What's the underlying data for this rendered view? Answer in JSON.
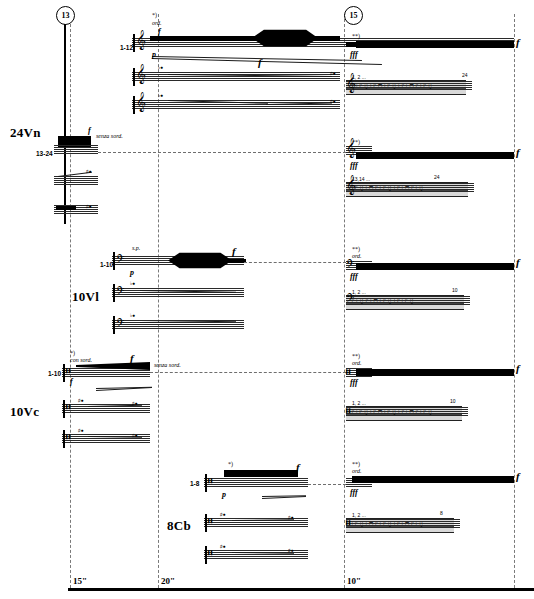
{
  "page": {
    "width": 534,
    "height": 599,
    "kind": "orchestral-graphic-score",
    "background": "#ffffff",
    "ink": "#000000"
  },
  "rehearsal_marks": [
    {
      "id": "mark-left",
      "label": "13",
      "x": 56,
      "y": 6
    },
    {
      "id": "mark-right",
      "label": "15",
      "x": 344,
      "y": 6
    }
  ],
  "systems": [
    {
      "id": "violins",
      "instrument_label": "24Vn",
      "player_ranges": [
        "1-12",
        "13-24"
      ],
      "techniques": [
        "ord.",
        "senza sord.",
        "s.p."
      ],
      "dynamics": [
        "p",
        "f",
        "fff"
      ],
      "footnotes": [
        "*)",
        "**)"
      ],
      "divisi_note": "1, 2 ..."
    },
    {
      "id": "violas",
      "instrument_label": "10Vl",
      "player_ranges": [
        "1-10"
      ],
      "techniques": [
        "s.p.",
        "ord."
      ],
      "dynamics": [
        "p",
        "f",
        "fff"
      ],
      "footnotes": [
        "**)"
      ],
      "divisi_note": "1, 2 ..."
    },
    {
      "id": "cellos",
      "instrument_label": "10Vc",
      "player_ranges": [
        "1-10"
      ],
      "techniques": [
        "con sord.",
        "senza sord.",
        "ord."
      ],
      "dynamics": [
        "f",
        "fff"
      ],
      "footnotes": [
        "*)",
        "**)"
      ],
      "divisi_note": "1, 2 ..."
    },
    {
      "id": "basses",
      "instrument_label": "8Cb",
      "player_ranges": [
        "1-8"
      ],
      "techniques": [
        "ord."
      ],
      "dynamics": [
        "p",
        "f",
        "fff"
      ],
      "footnotes": [
        "*)",
        "**)"
      ],
      "divisi_note": "1, 2 ..."
    }
  ],
  "labels": {
    "vn": "24Vn",
    "vl": "10Vl",
    "vc": "10Vc",
    "cb": "8Cb",
    "vn_range_upper": "1-12",
    "vn_range_lower": "13-24",
    "vl_range": "1-10",
    "vc_range": "1-10",
    "cb_range": "1-8",
    "ord": "ord.",
    "senza_sord": "senza sord.",
    "con_sord": "con sord.",
    "sp": "s.p.",
    "fn_one": "*)",
    "fn_two": "**)",
    "p": "p",
    "f": "f",
    "fff": "fff",
    "divisi_low": "1, 2 ...",
    "divisi_vn_low": "13,14 ...",
    "end_24": "24",
    "end_10": "10",
    "end_8": "8"
  },
  "timeline": {
    "marks": [
      {
        "label": "15\"",
        "x": 70
      },
      {
        "label": "20\"",
        "x": 158
      },
      {
        "label": "10\"",
        "x": 344
      }
    ],
    "bar_y": 588
  },
  "note_glyphs": {
    "row_a": "♪♩♪♫♩♪♬♩♪♫♩♪♩♬♪♩♪♫",
    "row_b": "♩♪♫♩♬♪♩♪♫♩♪♩♬♪♩♫",
    "row_c": "♪♩♫♪♩♬♩♪♫♩♪♩♪♫"
  },
  "colors": {
    "ink": "#000000",
    "staff_line": "#2a2a2a",
    "dashed_guide": "#7a7a7a",
    "note_strip": "#d9d9d9"
  }
}
